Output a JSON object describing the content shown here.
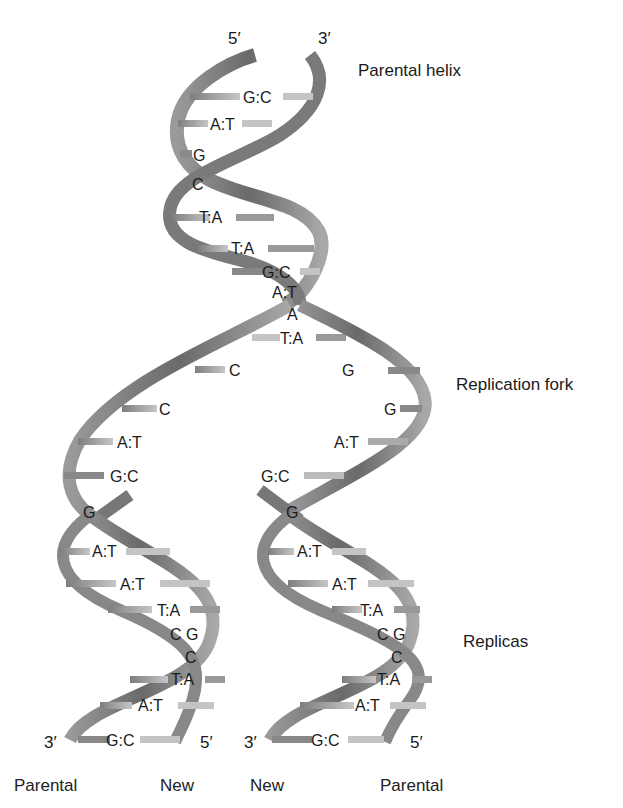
{
  "labels": {
    "parental_helix": "Parental helix",
    "replication_fork": "Replication fork",
    "replicas": "Replicas",
    "top_5": "5′",
    "top_3": "3′",
    "bl_3": "3′",
    "bl_5": "5′",
    "br_3": "3′",
    "br_5": "5′"
  },
  "footer": [
    "Parental",
    "New",
    "New",
    "Parental"
  ],
  "parental_pairs": [
    "G:C",
    "A:T",
    "G",
    "C",
    "T:A",
    "T:A",
    "G:C",
    "A:T",
    "A",
    "T:A"
  ],
  "fork_left": [
    "C",
    "C",
    "A:T",
    "G:C",
    "G"
  ],
  "fork_right": [
    "G",
    "G",
    "A:T",
    "G:C",
    "G"
  ],
  "replica_left": [
    "A:T",
    "A:T",
    "T:A",
    "C G",
    "C",
    "T:A",
    "A:T",
    "G:C"
  ],
  "replica_right": [
    "A:T",
    "A:T",
    "T:A",
    "C G",
    "C",
    "T:A",
    "A:T",
    "G:C"
  ],
  "colors": {
    "strand_dark": "#6e6e6e",
    "strand_light": "#b5b5b5",
    "rung_dark": "#8a8a8a",
    "rung_light": "#c8c8c8"
  }
}
